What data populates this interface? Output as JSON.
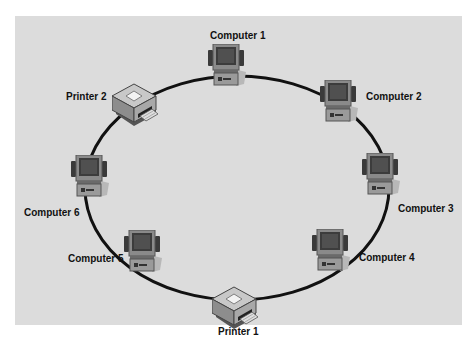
{
  "diagram": {
    "background_color": "#dcdcdc",
    "ring_color": "#111111",
    "nodes": [
      {
        "id": "computer-1",
        "type": "computer",
        "label": "Computer 1"
      },
      {
        "id": "computer-2",
        "type": "computer",
        "label": "Computer 2"
      },
      {
        "id": "computer-3",
        "type": "computer",
        "label": "Computer 3"
      },
      {
        "id": "computer-4",
        "type": "computer",
        "label": "Computer 4"
      },
      {
        "id": "printer-1",
        "type": "printer",
        "label": "Printer 1"
      },
      {
        "id": "computer-5",
        "type": "computer",
        "label": "Computer 5"
      },
      {
        "id": "computer-6",
        "type": "computer",
        "label": "Computer 6"
      },
      {
        "id": "printer-2",
        "type": "printer",
        "label": "Printer 2"
      }
    ],
    "connections": [
      [
        "computer-1",
        "computer-2"
      ],
      [
        "computer-2",
        "computer-3"
      ],
      [
        "computer-3",
        "computer-4"
      ],
      [
        "computer-4",
        "printer-1"
      ],
      [
        "printer-1",
        "computer-5"
      ],
      [
        "computer-5",
        "computer-6"
      ],
      [
        "computer-6",
        "printer-2"
      ],
      [
        "printer-2",
        "computer-1"
      ]
    ]
  }
}
